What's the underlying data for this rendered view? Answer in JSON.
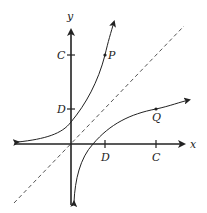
{
  "diagram": {
    "type": "function-and-inverse-graph",
    "axes": {
      "x_label": "x",
      "y_label": "y"
    },
    "tick_labels": {
      "y_axis": [
        {
          "label": "C",
          "value": "C"
        },
        {
          "label": "D",
          "value": "D"
        }
      ],
      "x_axis": [
        {
          "label": "D",
          "value": "D"
        },
        {
          "label": "C",
          "value": "C"
        }
      ]
    },
    "points": [
      {
        "label": "P",
        "coords": "(D, C)"
      },
      {
        "label": "Q",
        "coords": "(C, D)"
      }
    ],
    "curves": [
      {
        "name": "exponential-curve",
        "description": "increasing curve with horizontal asymptote on left, passing through P"
      },
      {
        "name": "logarithmic-curve",
        "description": "reflection across y = x, passing through Q, vertical asymptote at y-axis"
      }
    ],
    "reflection_line": {
      "name": "y = x",
      "style": "dashed"
    },
    "colors": {
      "stroke": "#222222",
      "dashed": "#555555",
      "background": "#ffffff"
    }
  }
}
